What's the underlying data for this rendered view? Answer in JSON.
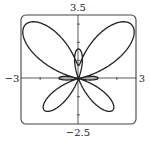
{
  "chart_data": {
    "type": "line",
    "title": "",
    "equation": "r = e^(sin θ) − 2cos(4θ)",
    "coordinate_system": "polar",
    "xlabel": "",
    "ylabel": "",
    "xlim": [
      -3,
      3
    ],
    "ylim": [
      -2.5,
      3.5
    ],
    "tick_labels": {
      "x_min": "−3",
      "x_max": "3",
      "y_max": "3.5",
      "y_min": "−2.5"
    },
    "x_ticks": [
      -2,
      -1,
      1,
      2
    ],
    "y_ticks": [
      -2,
      -1,
      1,
      2,
      3
    ],
    "grid": false,
    "legend": null,
    "series": [
      {
        "name": "butterfly curve",
        "theta_range": [
          0,
          6.2832
        ],
        "color": "#222222"
      }
    ]
  },
  "colors": {
    "curve": "#222222",
    "axes": "#333333",
    "frame": "#444444",
    "background": "#ffffff"
  }
}
